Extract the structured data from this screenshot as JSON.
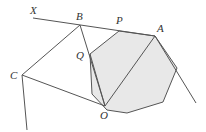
{
  "diagram": {
    "type": "geometry",
    "colors": {
      "background": "#ffffff",
      "fill": "#e8e8e8",
      "stroke": "#555555",
      "label": "#333333"
    },
    "labels": {
      "X": "X",
      "B": "B",
      "P": "P",
      "A": "A",
      "Q": "Q",
      "C": "C",
      "O": "O"
    },
    "points": {
      "X": [
        33,
        18
      ],
      "B": [
        80,
        25
      ],
      "P": [
        119,
        31
      ],
      "A": [
        155,
        36
      ],
      "Q": [
        90,
        54
      ],
      "C": [
        22,
        75
      ],
      "O": [
        105,
        106
      ]
    },
    "octagon": [
      [
        119,
        31
      ],
      [
        155,
        36
      ],
      [
        177,
        68
      ],
      [
        163,
        102
      ],
      [
        127,
        113
      ],
      [
        107,
        110
      ],
      [
        92,
        94
      ],
      [
        90,
        54
      ]
    ]
  }
}
